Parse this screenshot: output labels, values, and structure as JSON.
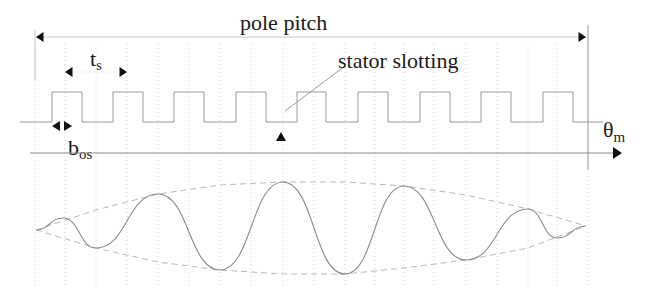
{
  "figure": {
    "labels": {
      "pole_pitch": "pole pitch",
      "slot_pitch_main": "t",
      "slot_pitch_sub": "s",
      "slot_opening_main": "b",
      "slot_opening_sub": "os",
      "stator_slotting": "stator slotting",
      "axis_main": "θ",
      "axis_sub": "m"
    },
    "colors": {
      "text": "#1a1a1a",
      "arrowheads": "#111111",
      "lines": "#9a9a9a",
      "envelope": "#b9b9b9",
      "waveform": "#8c8c8c"
    },
    "geometry": {
      "pole_pitch_arrow": {
        "x1": 36,
        "x2": 586,
        "y": 37
      },
      "slot_pitch_arrow": {
        "x1": 65,
        "x2": 127,
        "y": 72
      },
      "slot_opening_arrows": {
        "x1": 52,
        "x2": 72,
        "y": 126
      },
      "axis": {
        "x1": 30,
        "x2": 622,
        "y": 153
      },
      "slotting_low_y": 122,
      "slotting_high_y": 92,
      "marker_triangle": {
        "x": 281,
        "y": 138
      }
    },
    "slotting_segments": [
      {
        "level": "low",
        "x1": 20,
        "x2": 52
      },
      {
        "level": "high",
        "x1": 52,
        "x2": 82
      },
      {
        "level": "low",
        "x1": 82,
        "x2": 113
      },
      {
        "level": "high",
        "x1": 113,
        "x2": 143
      },
      {
        "level": "low",
        "x1": 143,
        "x2": 174
      },
      {
        "level": "high",
        "x1": 174,
        "x2": 204
      },
      {
        "level": "low",
        "x1": 204,
        "x2": 236
      },
      {
        "level": "high",
        "x1": 236,
        "x2": 266
      },
      {
        "level": "low",
        "x1": 266,
        "x2": 297
      },
      {
        "level": "high",
        "x1": 297,
        "x2": 326
      },
      {
        "level": "low",
        "x1": 326,
        "x2": 358
      },
      {
        "level": "high",
        "x1": 358,
        "x2": 388
      },
      {
        "level": "low",
        "x1": 388,
        "x2": 420
      },
      {
        "level": "high",
        "x1": 420,
        "x2": 450
      },
      {
        "level": "low",
        "x1": 450,
        "x2": 481
      },
      {
        "level": "high",
        "x1": 481,
        "x2": 511
      },
      {
        "level": "low",
        "x1": 511,
        "x2": 543
      },
      {
        "level": "high",
        "x1": 543,
        "x2": 573
      },
      {
        "level": "low",
        "x1": 573,
        "x2": 603
      }
    ],
    "grid_x": [
      35,
      65,
      96,
      127,
      158,
      189,
      220,
      251,
      283,
      314,
      345,
      375,
      404,
      434,
      466,
      497,
      528,
      557,
      588
    ],
    "waveform_points": [
      {
        "x": 36,
        "y": 230
      },
      {
        "x": 63,
        "y": 218
      },
      {
        "x": 96,
        "y": 248
      },
      {
        "x": 158,
        "y": 194
      },
      {
        "x": 220,
        "y": 270
      },
      {
        "x": 283,
        "y": 182
      },
      {
        "x": 345,
        "y": 274
      },
      {
        "x": 404,
        "y": 186
      },
      {
        "x": 466,
        "y": 260
      },
      {
        "x": 528,
        "y": 209
      },
      {
        "x": 557,
        "y": 238
      },
      {
        "x": 586,
        "y": 226
      }
    ],
    "envelope_upper": [
      {
        "x": 36,
        "y": 230
      },
      {
        "x": 96,
        "y": 210
      },
      {
        "x": 158,
        "y": 194
      },
      {
        "x": 220,
        "y": 185
      },
      {
        "x": 283,
        "y": 182
      },
      {
        "x": 345,
        "y": 182
      },
      {
        "x": 404,
        "y": 186
      },
      {
        "x": 466,
        "y": 195
      },
      {
        "x": 528,
        "y": 209
      },
      {
        "x": 586,
        "y": 226
      }
    ],
    "envelope_lower": [
      {
        "x": 36,
        "y": 230
      },
      {
        "x": 96,
        "y": 248
      },
      {
        "x": 158,
        "y": 262
      },
      {
        "x": 220,
        "y": 270
      },
      {
        "x": 283,
        "y": 274
      },
      {
        "x": 345,
        "y": 274
      },
      {
        "x": 404,
        "y": 268
      },
      {
        "x": 466,
        "y": 260
      },
      {
        "x": 528,
        "y": 248
      },
      {
        "x": 586,
        "y": 226
      }
    ]
  }
}
